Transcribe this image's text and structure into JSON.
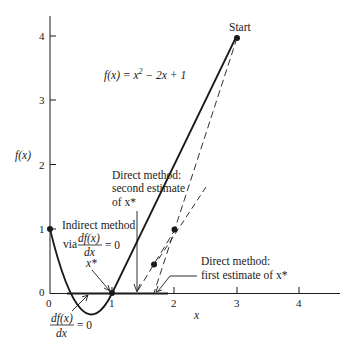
{
  "figure": {
    "function_label": "f(x) = x² − 2x + 1",
    "function_lhs": "f(x) = x",
    "function_sup": "2",
    "function_rhs": " − 2x + 1",
    "y_axis_label": "f(x)",
    "x_axis_label": "x",
    "start_label": "Start",
    "x_ticks": [
      "0",
      "1",
      "2",
      "3",
      "4"
    ],
    "y_ticks": [
      "0",
      "1",
      "2",
      "3",
      "4"
    ],
    "annotations": {
      "second_estimate": [
        "Direct method:",
        "second estimate",
        "of x*"
      ],
      "first_estimate": [
        "Direct method:",
        "first estimate of x*"
      ],
      "indirect": {
        "line1": "Indirect method",
        "via": "via",
        "frac_num": "df(x)",
        "frac_den": "dx",
        "eq": "= 0",
        "xstar": "x*"
      },
      "derivative_zero": {
        "frac_num": "df(x)",
        "frac_den": "dx",
        "eq": "= 0"
      }
    },
    "colors": {
      "ink": "#1a1a1a",
      "background": "#ffffff"
    }
  }
}
